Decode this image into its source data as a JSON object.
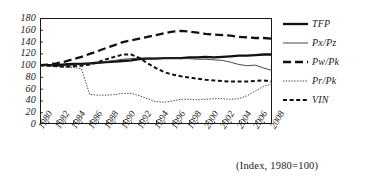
{
  "caption": "(Index, 1980=100)",
  "legend": {
    "position": "right",
    "items": [
      {
        "label": "TFP",
        "style": "thick-solid"
      },
      {
        "label": "Px/Pz",
        "style": "thin-solid"
      },
      {
        "label": "Pw/Pk",
        "style": "long-dash"
      },
      {
        "label": "Pr/Pk",
        "style": "dotted"
      },
      {
        "label": "VIN",
        "style": "dashed"
      }
    ]
  },
  "chart_data": {
    "type": "line",
    "title": "",
    "xlabel": "",
    "ylabel": "",
    "note": "(Index, 1980=100)",
    "grid": false,
    "legend_position": "right",
    "xlim": [
      1980,
      2008
    ],
    "ylim": [
      0,
      180
    ],
    "ytick_step": 20,
    "xtick_step": 2,
    "yticks": [
      0,
      20,
      40,
      60,
      80,
      100,
      120,
      140,
      160,
      180
    ],
    "xticks": [
      "1980",
      "1982",
      "1984",
      "1986",
      "1988",
      "1990",
      "1992",
      "1994",
      "1996",
      "1998",
      "2000",
      "2002",
      "2004",
      "2006",
      "2008"
    ],
    "x": [
      1980,
      1981,
      1982,
      1983,
      1984,
      1985,
      1986,
      1987,
      1988,
      1989,
      1990,
      1991,
      1992,
      1993,
      1994,
      1995,
      1996,
      1997,
      1998,
      1999,
      2000,
      2001,
      2002,
      2003,
      2004,
      2005,
      2006,
      2007,
      2008
    ],
    "series": [
      {
        "name": "TFP",
        "style": "thick-solid",
        "color": "#111111",
        "values": [
          100,
          100,
          100,
          101,
          102,
          102,
          103,
          104,
          105,
          106,
          107,
          108,
          110,
          111,
          111,
          112,
          112,
          112,
          113,
          113,
          114,
          113,
          114,
          115,
          116,
          116,
          117,
          118,
          118
        ]
      },
      {
        "name": "Px/Pz",
        "style": "thin-solid",
        "color": "#333333",
        "values": [
          100,
          99,
          98,
          99,
          100,
          101,
          102,
          104,
          106,
          108,
          110,
          111,
          112,
          112,
          112,
          112,
          112,
          111,
          111,
          110,
          110,
          109,
          108,
          105,
          101,
          99,
          100,
          95,
          91
        ]
      },
      {
        "name": "Pw/Pk",
        "style": "long-dash",
        "color": "#111111",
        "values": [
          100,
          101,
          103,
          106,
          110,
          114,
          119,
          124,
          129,
          134,
          139,
          142,
          145,
          148,
          151,
          154,
          157,
          158,
          157,
          155,
          153,
          152,
          151,
          150,
          148,
          147,
          146,
          146,
          145
        ]
      },
      {
        "name": "Pr/Pk",
        "style": "dotted",
        "color": "#444444",
        "values": [
          100,
          99,
          98,
          97,
          96,
          94,
          50,
          49,
          49,
          50,
          52,
          52,
          48,
          43,
          38,
          37,
          39,
          42,
          42,
          41,
          42,
          43,
          43,
          42,
          43,
          48,
          56,
          64,
          68
        ]
      },
      {
        "name": "VIN",
        "style": "dashed",
        "color": "#111111",
        "values": [
          100,
          99,
          98,
          97,
          98,
          99,
          101,
          105,
          110,
          114,
          118,
          118,
          112,
          103,
          95,
          88,
          84,
          81,
          79,
          77,
          75,
          74,
          73,
          72,
          72,
          72,
          73,
          74,
          72
        ]
      }
    ]
  }
}
